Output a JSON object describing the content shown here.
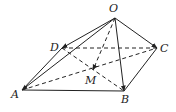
{
  "diagram": {
    "type": "geometry-pyramid",
    "colors": {
      "line": "#222222",
      "background": "#ffffff"
    },
    "points": {
      "O": {
        "label": "O",
        "x": 115,
        "y": 18,
        "lx": 109,
        "ly": 12
      },
      "A": {
        "label": "A",
        "x": 22,
        "y": 90,
        "lx": 11,
        "ly": 98
      },
      "B": {
        "label": "B",
        "x": 124,
        "y": 91,
        "lx": 121,
        "ly": 103
      },
      "C": {
        "label": "C",
        "x": 157,
        "y": 48,
        "lx": 160,
        "ly": 52
      },
      "D": {
        "label": "D",
        "x": 62,
        "y": 48,
        "lx": 50,
        "ly": 51
      },
      "M": {
        "label": "M",
        "x": 93,
        "y": 70,
        "lx": 85,
        "ly": 84
      }
    },
    "solid_edges": [
      [
        "A",
        "B"
      ],
      [
        "B",
        "C"
      ],
      [
        "D",
        "A"
      ]
    ],
    "dashed_edges": [
      [
        "D",
        "C"
      ],
      [
        "A",
        "C"
      ],
      [
        "D",
        "B"
      ]
    ],
    "vectors": [
      {
        "from": "O",
        "to": "A",
        "style": "solid"
      },
      {
        "from": "O",
        "to": "D",
        "style": "solid"
      },
      {
        "from": "O",
        "to": "B",
        "style": "solid"
      },
      {
        "from": "O",
        "to": "C",
        "style": "solid"
      },
      {
        "from": "O",
        "to": "M",
        "style": "dashed"
      }
    ]
  }
}
